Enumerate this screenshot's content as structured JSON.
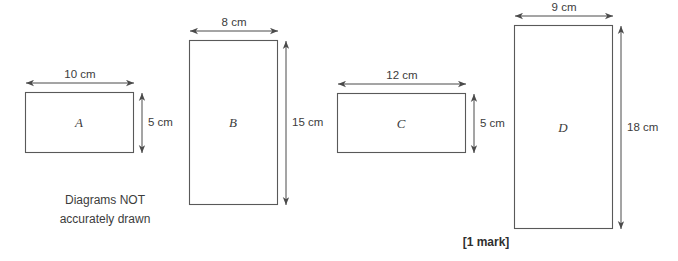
{
  "page": {
    "width": 678,
    "height": 261,
    "background": "#ffffff",
    "stroke_color": "#595959",
    "text_color": "#3c3c3c"
  },
  "note": {
    "line1": "Diagrams NOT",
    "line2": "accurately drawn",
    "x": 105,
    "y": 191
  },
  "mark": {
    "text": "[1 mark]",
    "x": 486,
    "y": 235
  },
  "figures": [
    {
      "id": "rect-a",
      "label": "A",
      "x": 25,
      "y": 92,
      "w": 108,
      "h": 60,
      "width_label": "10 cm",
      "height_label": "5 cm",
      "width_cm": 10,
      "height_cm": 5
    },
    {
      "id": "rect-b",
      "label": "B",
      "x": 189,
      "y": 40,
      "w": 88,
      "h": 164,
      "width_label": "8 cm",
      "height_label": "15 cm",
      "width_cm": 8,
      "height_cm": 15
    },
    {
      "id": "rect-c",
      "label": "C",
      "x": 337,
      "y": 93,
      "w": 128,
      "h": 59,
      "width_label": "12 cm",
      "height_label": "5 cm",
      "width_cm": 12,
      "height_cm": 5
    },
    {
      "id": "rect-d",
      "label": "D",
      "x": 514,
      "y": 25,
      "w": 98,
      "h": 203,
      "width_label": "9 cm",
      "height_label": "18 cm",
      "width_cm": 9,
      "height_cm": 18
    }
  ]
}
